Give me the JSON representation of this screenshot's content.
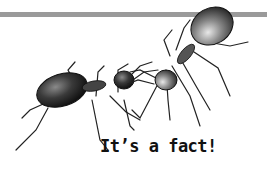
{
  "illustration": {
    "subject": "two-ants-touching",
    "bar_color": "#9a9a9a",
    "ant_color": "#2a2a2a"
  },
  "caption": {
    "text": "It’s a fact!"
  }
}
